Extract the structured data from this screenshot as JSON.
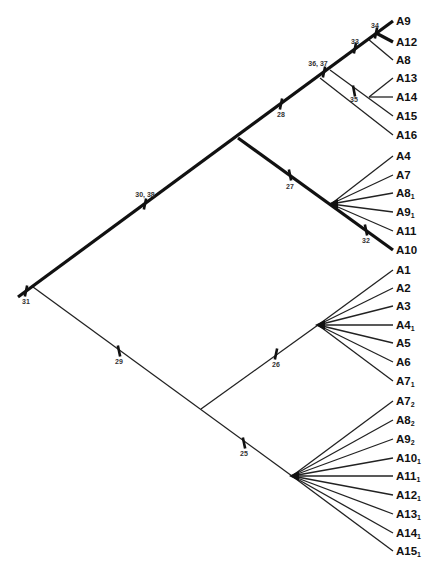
{
  "diagram": {
    "type": "cladogram",
    "leaves": [
      {
        "id": "A9",
        "base": "A9",
        "sub": "",
        "y": 21
      },
      {
        "id": "A12",
        "base": "A12",
        "sub": "",
        "y": 42
      },
      {
        "id": "A8",
        "base": "A8",
        "sub": "",
        "y": 60
      },
      {
        "id": "A13",
        "base": "A13",
        "sub": "",
        "y": 78
      },
      {
        "id": "A14",
        "base": "A14",
        "sub": "",
        "y": 97
      },
      {
        "id": "A15",
        "base": "A15",
        "sub": "",
        "y": 116
      },
      {
        "id": "A16",
        "base": "A16",
        "sub": "",
        "y": 135
      },
      {
        "id": "A4",
        "base": "A4",
        "sub": "",
        "y": 156
      },
      {
        "id": "A7",
        "base": "A7",
        "sub": "",
        "y": 175
      },
      {
        "id": "A8_1",
        "base": "A8",
        "sub": "1",
        "y": 193
      },
      {
        "id": "A9_1",
        "base": "A9",
        "sub": "1",
        "y": 212
      },
      {
        "id": "A11",
        "base": "A11",
        "sub": "",
        "y": 231
      },
      {
        "id": "A10",
        "base": "A10",
        "sub": "",
        "y": 250
      },
      {
        "id": "A1",
        "base": "A1",
        "sub": "",
        "y": 270
      },
      {
        "id": "A2",
        "base": "A2",
        "sub": "",
        "y": 288
      },
      {
        "id": "A3",
        "base": "A3",
        "sub": "",
        "y": 306
      },
      {
        "id": "A4_1",
        "base": "A4",
        "sub": "1",
        "y": 325
      },
      {
        "id": "A5",
        "base": "A5",
        "sub": "",
        "y": 343
      },
      {
        "id": "A6",
        "base": "A6",
        "sub": "",
        "y": 362
      },
      {
        "id": "A7_1",
        "base": "A7",
        "sub": "1",
        "y": 381
      },
      {
        "id": "A7_2",
        "base": "A7",
        "sub": "2",
        "y": 401
      },
      {
        "id": "A8_2",
        "base": "A8",
        "sub": "2",
        "y": 420
      },
      {
        "id": "A9_2",
        "base": "A9",
        "sub": "2",
        "y": 439
      },
      {
        "id": "A10_1",
        "base": "A10",
        "sub": "1",
        "y": 458
      },
      {
        "id": "A11_1",
        "base": "A11",
        "sub": "1",
        "y": 476
      },
      {
        "id": "A12_1",
        "base": "A12",
        "sub": "1",
        "y": 495
      },
      {
        "id": "A13_1",
        "base": "A13",
        "sub": "1",
        "y": 514
      },
      {
        "id": "A14_1",
        "base": "A14",
        "sub": "1",
        "y": 533
      },
      {
        "id": "A15_1",
        "base": "A15",
        "sub": "1",
        "y": 551
      }
    ],
    "node_labels": [
      {
        "text": "34",
        "x": 375,
        "y": 28
      },
      {
        "text": "33",
        "x": 355,
        "y": 44
      },
      {
        "text": "36, 37",
        "x": 318,
        "y": 66
      },
      {
        "text": "35",
        "x": 354,
        "y": 102
      },
      {
        "text": "28",
        "x": 281,
        "y": 117
      },
      {
        "text": "30, 38",
        "x": 145,
        "y": 197
      },
      {
        "text": "27",
        "x": 290,
        "y": 189
      },
      {
        "text": "32",
        "x": 366,
        "y": 243
      },
      {
        "text": "31",
        "x": 26,
        "y": 304
      },
      {
        "text": "29",
        "x": 119,
        "y": 364
      },
      {
        "text": "26",
        "x": 276,
        "y": 367
      },
      {
        "text": "25",
        "x": 244,
        "y": 456
      }
    ],
    "thick_edges": [
      [
        18,
        297,
        393,
        21
      ],
      [
        376,
        33,
        393,
        42
      ],
      [
        238,
        138,
        393,
        250
      ]
    ],
    "thin_edges": [
      [
        33,
        287,
        292,
        476
      ],
      [
        201,
        409,
        318,
        325
      ],
      [
        368,
        39,
        393,
        60
      ],
      [
        330,
        70,
        393,
        116
      ],
      [
        320,
        78,
        393,
        135
      ],
      [
        369,
        97,
        393,
        78
      ],
      [
        369,
        97,
        393,
        97
      ],
      [
        331,
        204,
        393,
        156
      ],
      [
        331,
        204,
        393,
        175
      ],
      [
        331,
        204,
        393,
        193
      ],
      [
        331,
        204,
        393,
        212
      ],
      [
        331,
        204,
        393,
        231
      ],
      [
        318,
        325,
        393,
        270
      ],
      [
        318,
        325,
        393,
        288
      ],
      [
        318,
        325,
        393,
        306
      ],
      [
        318,
        325,
        393,
        325
      ],
      [
        318,
        325,
        393,
        343
      ],
      [
        318,
        325,
        393,
        362
      ],
      [
        318,
        325,
        393,
        381
      ],
      [
        292,
        476,
        393,
        401
      ],
      [
        292,
        476,
        393,
        420
      ],
      [
        292,
        476,
        393,
        439
      ],
      [
        292,
        476,
        393,
        458
      ],
      [
        292,
        476,
        393,
        476
      ],
      [
        292,
        476,
        393,
        495
      ],
      [
        292,
        476,
        393,
        514
      ],
      [
        292,
        476,
        393,
        533
      ],
      [
        292,
        476,
        393,
        551
      ]
    ],
    "ticks": [
      [
        376,
        33,
        0.736
      ],
      [
        355,
        48,
        0.736
      ],
      [
        324,
        72,
        0.736
      ],
      [
        354,
        91,
        -0.63
      ],
      [
        281,
        104,
        0.736
      ],
      [
        145,
        204,
        0.736
      ],
      [
        290,
        175,
        -0.72
      ],
      [
        366,
        230,
        -0.72
      ],
      [
        26,
        291,
        0.736
      ],
      [
        119,
        351,
        -0.744
      ],
      [
        276,
        354,
        0.72
      ],
      [
        244,
        443,
        -0.744
      ]
    ],
    "fan_nodes": [
      [
        331,
        204
      ],
      [
        318,
        325
      ],
      [
        292,
        476
      ]
    ]
  }
}
